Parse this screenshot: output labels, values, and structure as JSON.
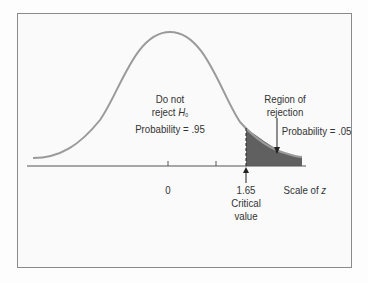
{
  "diagram": {
    "type": "normal-distribution-one-tailed-test",
    "colors": {
      "curve": "#9a9a9a",
      "rejection_fill": "#606060",
      "axis": "#555555",
      "frame": "#8a8a8a",
      "text": "#333333"
    },
    "labels": {
      "accept_line1": "Do not",
      "accept_line2": "reject ",
      "accept_h": "H",
      "accept_h_sub": "0",
      "accept_probability": "Probability = .95",
      "rejection_line1": "Region of",
      "rejection_line2": "rejection",
      "rejection_probability": "Probability = .05"
    },
    "axis": {
      "tick_zero": "0",
      "tick_critical": "1.65",
      "critical_line1": "Critical",
      "critical_line2": "value",
      "scale_label": "Scale of ",
      "scale_var": "z"
    }
  }
}
